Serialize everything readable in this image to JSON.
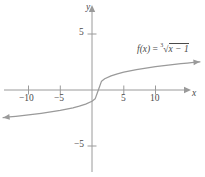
{
  "figure": {
    "type": "cartesian-graph",
    "background": "#ffffff",
    "curve_color": "#9a9a9a",
    "axis_color": "#9a9a9a",
    "text_color": "#4a4a4a"
  },
  "equation": {
    "fx": "f(x)",
    "equals": "=",
    "radical_index": "3",
    "radical_symbol": "√",
    "radicand": "x − 1",
    "full": "f(x) = ∛(x − 1)"
  },
  "axes": {
    "x_label": "x",
    "y_label": "y",
    "x_ticks": [
      {
        "value": -10,
        "label": "−10"
      },
      {
        "value": -5,
        "label": "−5"
      },
      {
        "value": 5,
        "label": "5"
      },
      {
        "value": 10,
        "label": "10"
      }
    ],
    "y_ticks": [
      {
        "value": 5,
        "label": "5"
      },
      {
        "value": -5,
        "label": "−5"
      }
    ]
  },
  "chart_data": {
    "type": "line",
    "title": "",
    "xlabel": "x",
    "ylabel": "y",
    "xlim": [
      -14.5,
      17.5
    ],
    "ylim": [
      -8.0,
      7.5
    ],
    "grid": false,
    "legend": "none",
    "annotations": [
      {
        "text": "f(x) = ∛(x − 1)",
        "x": 11.5,
        "y": 4.2
      }
    ],
    "series": [
      {
        "name": "f(x) = cbrt(x - 1)",
        "color": "#9a9a9a",
        "arrow_start": true,
        "arrow_end": true,
        "x": [
          -14.0,
          -13.0,
          -12.0,
          -11.0,
          -10.0,
          -9.0,
          -8.0,
          -7.0,
          -6.0,
          -5.0,
          -4.0,
          -3.0,
          -2.0,
          -1.0,
          0.0,
          0.5,
          1.0,
          1.5,
          2.0,
          3.0,
          4.0,
          5.0,
          6.0,
          7.0,
          8.0,
          9.0,
          10.0,
          11.0,
          12.0,
          13.0,
          14.0,
          15.0,
          16.0,
          17.0
        ],
        "y": [
          -2.47,
          -2.41,
          -2.35,
          -2.29,
          -2.22,
          -2.15,
          -2.08,
          -2.0,
          -1.91,
          -1.82,
          -1.71,
          -1.59,
          -1.44,
          -1.26,
          -1.0,
          -0.79,
          0.0,
          0.79,
          1.0,
          1.26,
          1.44,
          1.59,
          1.71,
          1.82,
          1.91,
          2.0,
          2.08,
          2.15,
          2.22,
          2.29,
          2.35,
          2.41,
          2.47,
          2.52
        ]
      }
    ]
  }
}
